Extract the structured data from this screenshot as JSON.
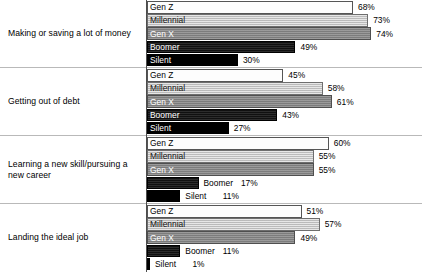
{
  "chart_data": {
    "type": "bar",
    "title": "",
    "subtitle": "",
    "xlabel": "",
    "ylabel": "",
    "orientation": "horizontal",
    "grid": false,
    "legend_position": "in-bar",
    "xlim": [
      0,
      100
    ],
    "value_suffix": "%",
    "categories": [
      "Making or saving a lot of money",
      "Getting out of debt",
      "Learning a new skill/pursuing a new career",
      "Landing the ideal job"
    ],
    "series": [
      {
        "name": "Gen Z",
        "values": [
          68,
          45,
          60,
          51
        ]
      },
      {
        "name": "Millennial",
        "values": [
          73,
          58,
          55,
          57
        ]
      },
      {
        "name": "Gen X",
        "values": [
          74,
          61,
          55,
          49
        ]
      },
      {
        "name": "Boomer",
        "values": [
          49,
          43,
          17,
          11
        ]
      },
      {
        "name": "Silent",
        "values": [
          30,
          27,
          11,
          1
        ]
      }
    ],
    "colors": {
      "Gen Z": "#fdfdfd",
      "Millennial": "#c9c9c9",
      "Gen X": "#8a8a8a",
      "Boomer": "#141414",
      "Silent": "#000000",
      "axis": "#4d4d4d",
      "divider": "#b9b9b9",
      "background": "#ffffff",
      "text": "#000000"
    }
  },
  "groups": [
    {
      "label": "Making or saving a lot of money",
      "bars": [
        {
          "series": "Gen Z",
          "value_label": "68%",
          "value": 68
        },
        {
          "series": "Millennial",
          "value_label": "73%",
          "value": 73
        },
        {
          "series": "Gen X",
          "value_label": "74%",
          "value": 74
        },
        {
          "series": "Boomer",
          "value_label": "49%",
          "value": 49
        },
        {
          "series": "Silent",
          "value_label": "30%",
          "value": 30
        }
      ]
    },
    {
      "label": "Getting out of debt",
      "bars": [
        {
          "series": "Gen Z",
          "value_label": "45%",
          "value": 45
        },
        {
          "series": "Millennial",
          "value_label": "58%",
          "value": 58
        },
        {
          "series": "Gen X",
          "value_label": "61%",
          "value": 61
        },
        {
          "series": "Boomer",
          "value_label": "43%",
          "value": 43
        },
        {
          "series": "Silent",
          "value_label": "27%",
          "value": 27
        }
      ]
    },
    {
      "label": "Learning a new skill/pursuing a new career",
      "bars": [
        {
          "series": "Gen Z",
          "value_label": "60%",
          "value": 60
        },
        {
          "series": "Millennial",
          "value_label": "55%",
          "value": 55
        },
        {
          "series": "Gen X",
          "value_label": "55%",
          "value": 55
        },
        {
          "series": "Boomer",
          "value_label": "17%",
          "value": 17
        },
        {
          "series": "Silent",
          "value_label": "11%",
          "value": 11
        }
      ]
    },
    {
      "label": "Landing the ideal job",
      "bars": [
        {
          "series": "Gen Z",
          "value_label": "51%",
          "value": 51
        },
        {
          "series": "Millennial",
          "value_label": "57%",
          "value": 57
        },
        {
          "series": "Gen X",
          "value_label": "49%",
          "value": 49
        },
        {
          "series": "Boomer",
          "value_label": "11%",
          "value": 11
        },
        {
          "series": "Silent",
          "value_label": "1%",
          "value": 1
        }
      ]
    }
  ]
}
